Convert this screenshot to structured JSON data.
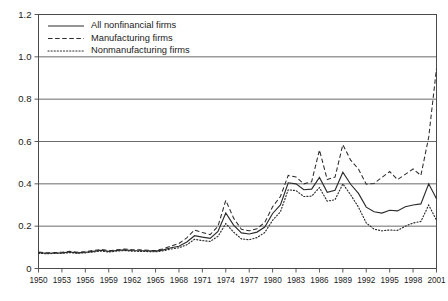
{
  "chart_data": {
    "type": "line",
    "title": "",
    "xlabel": "",
    "ylabel": "",
    "xlim": [
      1950,
      2001
    ],
    "ylim": [
      0,
      1.2
    ],
    "grid": true,
    "grid_axis": "y",
    "legend_position": "top-left",
    "y_ticks": [
      "0",
      "0.2",
      "0.4",
      "0.6",
      "0.8",
      "1.0",
      "1.2"
    ],
    "y_tick_values": [
      0,
      0.2,
      0.4,
      0.6,
      0.8,
      1.0,
      1.2
    ],
    "x_ticks": [
      "1950",
      "1953",
      "1956",
      "1959",
      "1962",
      "1965",
      "1968",
      "1971",
      "1974",
      "1977",
      "1980",
      "1983",
      "1986",
      "1989",
      "1992",
      "1995",
      "1998",
      "2001"
    ],
    "x_tick_values": [
      1950,
      1953,
      1956,
      1959,
      1962,
      1965,
      1968,
      1971,
      1974,
      1977,
      1980,
      1983,
      1986,
      1989,
      1992,
      1995,
      1998,
      2001
    ],
    "x": [
      1950,
      1951,
      1952,
      1953,
      1954,
      1955,
      1956,
      1957,
      1958,
      1959,
      1960,
      1961,
      1962,
      1963,
      1964,
      1965,
      1966,
      1967,
      1968,
      1969,
      1970,
      1971,
      1972,
      1973,
      1974,
      1975,
      1976,
      1977,
      1978,
      1979,
      1980,
      1981,
      1982,
      1983,
      1984,
      1985,
      1986,
      1987,
      1988,
      1989,
      1990,
      1991,
      1992,
      1993,
      1994,
      1995,
      1996,
      1997,
      1998,
      1999,
      2000,
      2001
    ],
    "series": [
      {
        "name": "All nonfinancial firms",
        "style": "solid",
        "color": "#2b2b2b",
        "values": [
          0.075,
          0.072,
          0.073,
          0.074,
          0.078,
          0.074,
          0.077,
          0.081,
          0.086,
          0.081,
          0.085,
          0.088,
          0.085,
          0.084,
          0.083,
          0.082,
          0.088,
          0.098,
          0.105,
          0.125,
          0.155,
          0.148,
          0.142,
          0.175,
          0.262,
          0.205,
          0.168,
          0.163,
          0.172,
          0.196,
          0.26,
          0.3,
          0.405,
          0.4,
          0.372,
          0.375,
          0.43,
          0.36,
          0.37,
          0.455,
          0.398,
          0.355,
          0.29,
          0.268,
          0.262,
          0.275,
          0.272,
          0.292,
          0.3,
          0.305,
          0.4,
          0.33
        ]
      },
      {
        "name": "Manufacturing firms",
        "style": "dashed",
        "color": "#2b2b2b",
        "values": [
          0.078,
          0.074,
          0.075,
          0.077,
          0.081,
          0.077,
          0.08,
          0.085,
          0.09,
          0.084,
          0.088,
          0.092,
          0.089,
          0.088,
          0.086,
          0.085,
          0.093,
          0.106,
          0.118,
          0.145,
          0.182,
          0.17,
          0.16,
          0.2,
          0.322,
          0.238,
          0.185,
          0.178,
          0.188,
          0.218,
          0.292,
          0.34,
          0.44,
          0.432,
          0.4,
          0.41,
          0.56,
          0.42,
          0.432,
          0.585,
          0.512,
          0.47,
          0.398,
          0.402,
          0.43,
          0.458,
          0.42,
          0.445,
          0.47,
          0.44,
          0.62,
          0.945
        ]
      },
      {
        "name": "Nonmanufacturing firms",
        "style": "dotted",
        "color": "#2b2b2b",
        "values": [
          0.072,
          0.07,
          0.071,
          0.072,
          0.075,
          0.072,
          0.074,
          0.078,
          0.082,
          0.078,
          0.082,
          0.085,
          0.082,
          0.081,
          0.08,
          0.079,
          0.084,
          0.092,
          0.098,
          0.112,
          0.138,
          0.132,
          0.128,
          0.152,
          0.212,
          0.172,
          0.14,
          0.136,
          0.146,
          0.17,
          0.228,
          0.268,
          0.372,
          0.368,
          0.34,
          0.342,
          0.382,
          0.318,
          0.325,
          0.4,
          0.348,
          0.29,
          0.215,
          0.186,
          0.178,
          0.182,
          0.18,
          0.2,
          0.215,
          0.222,
          0.3,
          0.228
        ]
      }
    ]
  },
  "legend": {
    "items": [
      {
        "label": "All nonfinancial firms",
        "style": "solid"
      },
      {
        "label": "Manufacturing firms",
        "style": "dashed"
      },
      {
        "label": "Nonmanufacturing firms",
        "style": "dotted"
      }
    ]
  }
}
